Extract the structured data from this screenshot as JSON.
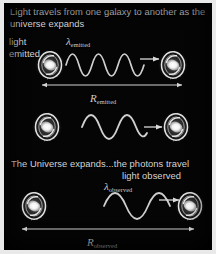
{
  "figure": {
    "domain": "diagram",
    "background_color": "#050505",
    "frame_color": "#e9e9e9",
    "text_color": "#d6d6d6",
    "title": "Light travels from one galaxy to another as the universe expands"
  },
  "labels": {
    "light_emitted": "light\nemitted",
    "light_emitted_line1": "light",
    "light_emitted_line2": "emitted",
    "universe_expands": "The Universe expands...the photons travel",
    "light_observed": "light observed",
    "lambda_symbol": "λ",
    "lambda_emitted_sub": "emitted",
    "lambda_observed_sub": "observed",
    "r_symbol": "R",
    "r_emitted_sub": "emitted",
    "r_observed_sub": "observed"
  },
  "rows": [
    {
      "name": "emission-row",
      "description": "Light emitted from left galaxy with short wavelength travelling right",
      "wavelength": "short",
      "separation_label": "R emitted"
    },
    {
      "name": "travel-row",
      "description": "Photon in transit between the two galaxies as space stretches",
      "wavelength": "medium",
      "separation_label": ""
    },
    {
      "name": "observation-row",
      "description": "Light observed at right galaxy with stretched wavelength",
      "wavelength": "long",
      "separation_label": "R observed"
    }
  ],
  "icons": {
    "galaxy": "spiral-galaxy-icon",
    "wave": "light-wave-icon",
    "direction_arrow": "arrow-right-icon",
    "measure_arrow": "double-headed-arrow-icon"
  }
}
